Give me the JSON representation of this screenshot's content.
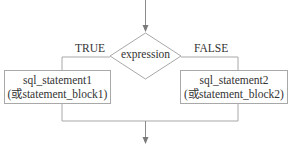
{
  "diagram": {
    "type": "flowchart",
    "decision": {
      "label": "expression"
    },
    "branches": {
      "true": {
        "label": "TRUE",
        "box": {
          "line1": "sql_statement1",
          "line2": "(或statement_block1)"
        }
      },
      "false": {
        "label": "FALSE",
        "box": {
          "line1": "sql_statement2",
          "line2": "(或statement_block2)"
        }
      }
    },
    "colors": {
      "line": "#8c8c8c",
      "border": "#a8a8a8",
      "text": "#333333",
      "background": "#ffffff"
    }
  }
}
